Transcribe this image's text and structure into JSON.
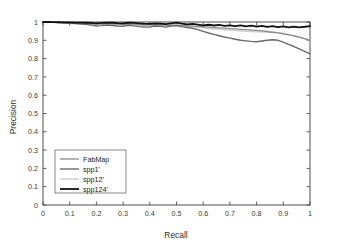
{
  "chart_data": {
    "type": "line",
    "title": "",
    "xlabel": "Recall",
    "ylabel": "Precision",
    "xlim": [
      0,
      1
    ],
    "ylim": [
      0,
      1
    ],
    "grid": false,
    "legend_position": "lower-left",
    "xticks": [
      "0",
      "0.1",
      "0.2",
      "0.3",
      "0.4",
      "0.5",
      "0.6",
      "0.7",
      "0.8",
      "0.9",
      "1"
    ],
    "yticks": [
      "0",
      "0.1",
      "0.2",
      "0.3",
      "0.4",
      "0.5",
      "0.6",
      "0.7",
      "0.8",
      "0.9",
      "1"
    ],
    "x": [
      0,
      0.02,
      0.04,
      0.06,
      0.08,
      0.1,
      0.12,
      0.14,
      0.16,
      0.18,
      0.2,
      0.22,
      0.24,
      0.26,
      0.28,
      0.3,
      0.32,
      0.34,
      0.36,
      0.38,
      0.4,
      0.42,
      0.44,
      0.46,
      0.48,
      0.5,
      0.52,
      0.54,
      0.56,
      0.58,
      0.6,
      0.62,
      0.64,
      0.66,
      0.68,
      0.7,
      0.72,
      0.74,
      0.76,
      0.78,
      0.8,
      0.82,
      0.84,
      0.86,
      0.88,
      0.9,
      0.92,
      0.94,
      0.96,
      0.98,
      1
    ],
    "series": [
      {
        "name": "FabMap",
        "color": "#8c8c8c",
        "width": 1.3,
        "values": [
          1.0,
          0.999,
          0.998,
          0.997,
          0.997,
          0.996,
          0.995,
          0.994,
          0.993,
          0.992,
          0.99,
          0.989,
          0.991,
          0.99,
          0.988,
          0.987,
          0.989,
          0.988,
          0.986,
          0.985,
          0.984,
          0.986,
          0.985,
          0.983,
          0.982,
          0.981,
          0.98,
          0.979,
          0.978,
          0.976,
          0.974,
          0.972,
          0.97,
          0.968,
          0.966,
          0.964,
          0.962,
          0.96,
          0.958,
          0.956,
          0.954,
          0.951,
          0.948,
          0.944,
          0.94,
          0.935,
          0.93,
          0.924,
          0.917,
          0.909,
          0.9
        ]
      },
      {
        "name": "spp1'",
        "color": "#6b6b6b",
        "width": 1.4,
        "values": [
          1.0,
          0.999,
          0.998,
          0.996,
          0.994,
          0.993,
          0.991,
          0.989,
          0.987,
          0.984,
          0.978,
          0.98,
          0.983,
          0.981,
          0.978,
          0.976,
          0.982,
          0.979,
          0.975,
          0.973,
          0.972,
          0.978,
          0.976,
          0.972,
          0.978,
          0.981,
          0.975,
          0.97,
          0.966,
          0.958,
          0.949,
          0.94,
          0.932,
          0.925,
          0.918,
          0.912,
          0.906,
          0.9,
          0.897,
          0.894,
          0.892,
          0.896,
          0.9,
          0.903,
          0.9,
          0.89,
          0.878,
          0.866,
          0.853,
          0.84,
          0.826
        ]
      },
      {
        "name": "spp12'",
        "color": "#cfcfcf",
        "width": 1.5,
        "values": [
          1.0,
          0.999,
          0.998,
          0.997,
          0.996,
          0.995,
          0.994,
          0.993,
          0.992,
          0.99,
          0.986,
          0.988,
          0.99,
          0.988,
          0.986,
          0.984,
          0.988,
          0.986,
          0.983,
          0.981,
          0.98,
          0.984,
          0.982,
          0.979,
          0.983,
          0.985,
          0.981,
          0.978,
          0.975,
          0.971,
          0.968,
          0.965,
          0.962,
          0.96,
          0.958,
          0.956,
          0.954,
          0.952,
          0.95,
          0.948,
          0.947,
          0.946,
          0.945,
          0.944,
          0.942,
          0.938,
          0.932,
          0.925,
          0.917,
          0.908,
          0.9
        ]
      },
      {
        "name": "spp124'",
        "color": "#111111",
        "width": 1.8,
        "values": [
          1.0,
          1.0,
          0.999,
          0.999,
          0.998,
          0.998,
          0.997,
          0.997,
          0.996,
          0.995,
          0.993,
          0.995,
          0.997,
          0.996,
          0.994,
          0.993,
          0.996,
          0.995,
          0.993,
          0.991,
          0.99,
          0.993,
          0.991,
          0.988,
          0.992,
          0.996,
          0.991,
          0.987,
          0.99,
          0.986,
          0.982,
          0.985,
          0.981,
          0.984,
          0.979,
          0.982,
          0.977,
          0.981,
          0.976,
          0.98,
          0.975,
          0.979,
          0.973,
          0.977,
          0.972,
          0.976,
          0.971,
          0.975,
          0.971,
          0.974,
          0.978
        ]
      }
    ]
  },
  "axes": {
    "x_title": "Recall",
    "y_title": "Precision"
  },
  "legend": {
    "entries": [
      {
        "label": "FabMap"
      },
      {
        "label": "spp1'"
      },
      {
        "label": "spp12'"
      },
      {
        "label": "spp124'"
      }
    ]
  }
}
